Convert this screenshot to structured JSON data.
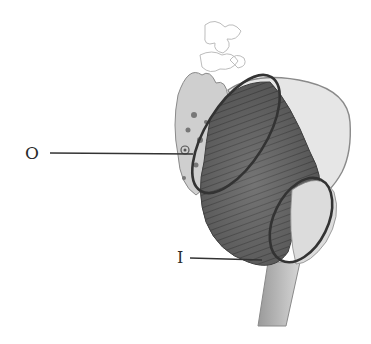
{
  "figure": {
    "labels": [
      {
        "id": "O",
        "text": "O"
      },
      {
        "id": "I",
        "text": "I"
      }
    ]
  },
  "colors": {
    "ink": "#2a2a2a",
    "shade_dark": "#555555",
    "shade_mid": "#8a8a8a",
    "shade_light": "#d8d8d8",
    "background": "#ffffff"
  }
}
